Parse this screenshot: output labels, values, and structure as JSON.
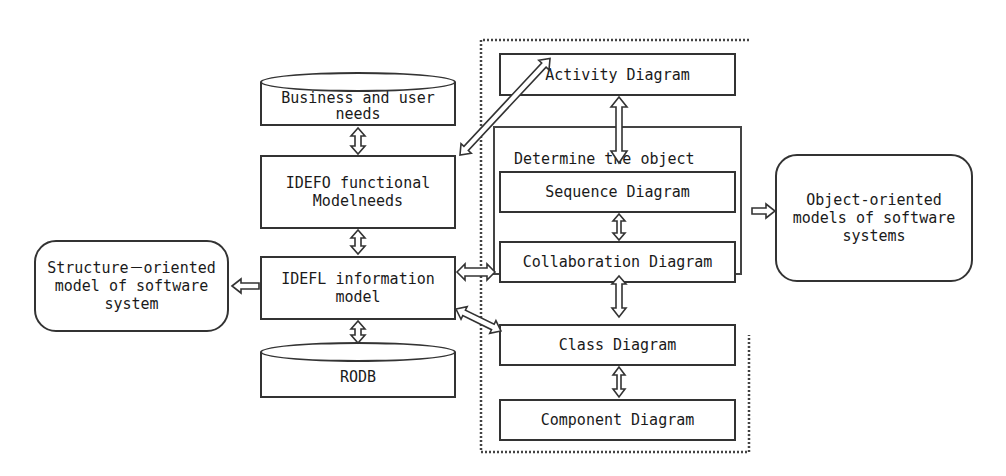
{
  "diagram": {
    "nodes": {
      "business_needs": "Business and user\n needs",
      "idef0": "IDEFO functional\nModelneeds",
      "idef1": "IDEFL information\nmodel",
      "rodb": "RODB",
      "structure_model": "Structure－oriented\nmodel of software\nsystem",
      "activity": "Activity Diagram",
      "sequence": "Sequence Diagram",
      "collaboration": "Collaboration Diagram",
      "class": "Class Diagram",
      "component": "Component Diagram",
      "object_model": "Object-oriented\nmodels of software\nsystems"
    },
    "groups": {
      "determine_object": "Determine   the object"
    },
    "edges": [
      {
        "from": "business_needs",
        "to": "idef0",
        "type": "bidirectional"
      },
      {
        "from": "idef0",
        "to": "idef1",
        "type": "bidirectional"
      },
      {
        "from": "idef1",
        "to": "rodb",
        "type": "bidirectional"
      },
      {
        "from": "idef1",
        "to": "structure_model",
        "type": "directed"
      },
      {
        "from": "idef0",
        "to": "activity",
        "type": "bidirectional"
      },
      {
        "from": "idef1",
        "to": "collaboration",
        "type": "bidirectional"
      },
      {
        "from": "idef1",
        "to": "class",
        "type": "bidirectional"
      },
      {
        "from": "activity",
        "to": "sequence",
        "type": "bidirectional"
      },
      {
        "from": "sequence",
        "to": "collaboration",
        "type": "bidirectional"
      },
      {
        "from": "collaboration",
        "to": "class",
        "type": "bidirectional"
      },
      {
        "from": "class",
        "to": "component",
        "type": "bidirectional"
      },
      {
        "from": "determine_object",
        "to": "object_model",
        "type": "directed"
      }
    ]
  }
}
